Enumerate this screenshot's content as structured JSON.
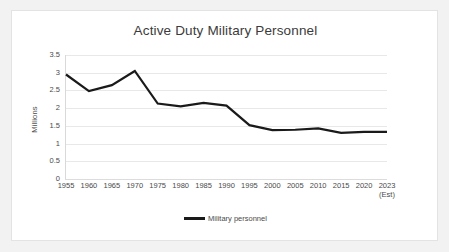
{
  "chart_data": {
    "type": "line",
    "title": "Active Duty Military Personnel",
    "xlabel": "",
    "ylabel": "Millions",
    "categories": [
      "1955",
      "1960",
      "1965",
      "1970",
      "1975",
      "1980",
      "1985",
      "1990",
      "1995",
      "2000",
      "2005",
      "2010",
      "2015",
      "2020",
      "2023"
    ],
    "category_sublabels": [
      "",
      "",
      "",
      "",
      "",
      "",
      "",
      "",
      "",
      "",
      "",
      "",
      "",
      "",
      "(Est)"
    ],
    "series": [
      {
        "name": "Military personnel",
        "color": "#1a1a1a",
        "values": [
          2.95,
          2.48,
          2.65,
          3.05,
          2.13,
          2.05,
          2.15,
          2.07,
          1.52,
          1.38,
          1.39,
          1.43,
          1.3,
          1.33,
          1.33
        ]
      }
    ],
    "ylim": [
      0,
      3.5
    ],
    "ytick_labels": [
      "3.5",
      "3",
      "2.5",
      "2",
      "1.5",
      "1",
      "0.5",
      "0"
    ],
    "ytick_values": [
      3.5,
      3,
      2.5,
      2,
      1.5,
      1,
      0.5,
      0
    ],
    "grid": true,
    "legend_position": "bottom"
  },
  "legend": {
    "entries": [
      {
        "label": "Military personnel"
      }
    ]
  }
}
